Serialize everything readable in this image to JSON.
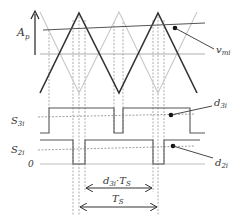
{
  "diagram": {
    "colors": {
      "carrier_dark": "#333333",
      "carrier_light": "#c8c8c8",
      "axis": "#9a9a9a",
      "dashed": "#8a8a8a",
      "waveform": "#555555",
      "text": "#333333"
    },
    "labels": {
      "amplitude_main": "A",
      "amplitude_sub": "p",
      "reference_main": "v",
      "reference_sub": "mi",
      "s3_main": "S",
      "s3_sub": "3i",
      "s2_main": "S",
      "s2_sub": "2i",
      "zero": "0",
      "d3_main": "d",
      "d3_sub": "3i",
      "d2_main": "d",
      "d2_sub": "2i",
      "duty_period_main": "d",
      "duty_period_sub": "3i",
      "duty_period_suffix": "·T",
      "duty_period_suffix_sub": "S",
      "period_main": "T",
      "period_sub": "S"
    },
    "signals": [
      {
        "name": "carrier_dark",
        "type": "triangle",
        "points": [
          [
            40,
            93
          ],
          [
            79,
            13
          ],
          [
            119,
            93
          ],
          [
            158,
            13
          ],
          [
            197,
            93
          ]
        ]
      },
      {
        "name": "carrier_light",
        "type": "triangle",
        "points": [
          [
            40,
            12
          ],
          [
            79,
            93
          ],
          [
            119,
            12
          ],
          [
            158,
            93
          ],
          [
            197,
            12
          ]
        ]
      },
      {
        "name": "v_mi",
        "type": "reference",
        "points": [
          [
            43,
            30
          ],
          [
            205,
            23
          ]
        ]
      },
      {
        "name": "S_3i",
        "type": "pwm",
        "low_y": 133,
        "high_y": 108,
        "edges_high": [
          [
            49,
            114
          ],
          [
            123,
            190
          ]
        ]
      },
      {
        "name": "S_2i",
        "type": "pwm",
        "low_y": 164,
        "high_y": 140,
        "edges_low": [
          [
            73,
            85
          ],
          [
            153,
            164
          ]
        ]
      }
    ]
  }
}
